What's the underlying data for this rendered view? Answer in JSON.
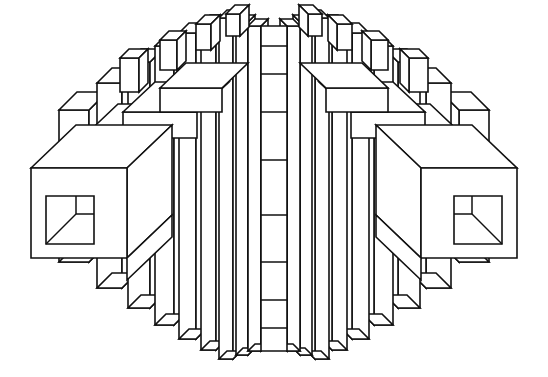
{
  "artwork": {
    "title": "Axonometric Radial Block Structure",
    "style": "black-and-white line drawing",
    "canvas": {
      "width": 548,
      "height": 377
    },
    "background_color": "#ffffff",
    "line_color": "#111111",
    "fill_color": "#ffffff",
    "line_width": 1.6,
    "symmetry": "bilateral-mirror-about-vertical-center",
    "center_x": 274,
    "description": "An oval silhouette built from stepped rectangular slabs radiating outward from a central vertical panel; the outermost left and right blocks are large cubes each containing a square window with a quarter square and a diagonal."
  },
  "center_panel": {
    "name": "central-vertical-panel",
    "x": 261,
    "width": 26,
    "top": 26,
    "bottom": 351,
    "divider_y": [
      46,
      74,
      112,
      160,
      215,
      262,
      300,
      328
    ]
  },
  "ring_columns": {
    "note": "Each ring is a mirrored pair of vertical slab columns stepping outward and downward.",
    "rings": [
      {
        "index": 0,
        "x_offset": 13,
        "slab_width": 13,
        "top": 26,
        "bottom": 351,
        "depth": 7,
        "riser": 0
      },
      {
        "index": 1,
        "x_offset": 26,
        "slab_width": 12,
        "top": 22,
        "bottom": 355,
        "depth": 7,
        "riser": 0
      },
      {
        "index": 2,
        "x_offset": 41,
        "slab_width": 14,
        "top": 18,
        "bottom": 359,
        "depth": 8,
        "riser": 0
      },
      {
        "index": 3,
        "x_offset": 58,
        "slab_width": 15,
        "top": 24,
        "bottom": 350,
        "depth": 9,
        "riser": 0
      },
      {
        "index": 4,
        "x_offset": 78,
        "slab_width": 17,
        "top": 33,
        "bottom": 339,
        "depth": 10,
        "riser": 0
      },
      {
        "index": 5,
        "x_offset": 100,
        "slab_width": 19,
        "top": 46,
        "bottom": 325,
        "depth": 11,
        "riser": 0
      },
      {
        "index": 6,
        "x_offset": 124,
        "slab_width": 22,
        "top": 62,
        "bottom": 308,
        "depth": 13,
        "riser": 0
      },
      {
        "index": 7,
        "x_offset": 152,
        "slab_width": 25,
        "top": 83,
        "bottom": 288,
        "depth": 15,
        "riser": 0
      },
      {
        "index": 8,
        "x_offset": 185,
        "slab_width": 30,
        "top": 110,
        "bottom": 262,
        "depth": 18,
        "riser": 0
      }
    ]
  },
  "cap_blocks": {
    "note": "Short raised caps sitting on top of alternating columns, drawn as small 3-face boxes.",
    "left": [
      {
        "name": "cap-1",
        "x": 226,
        "y": 14,
        "w": 14,
        "h": 22
      },
      {
        "name": "cap-2",
        "x": 196,
        "y": 24,
        "w": 15,
        "h": 26
      },
      {
        "name": "cap-3",
        "x": 160,
        "y": 40,
        "w": 17,
        "h": 30
      },
      {
        "name": "cap-4",
        "x": 120,
        "y": 58,
        "w": 19,
        "h": 34
      }
    ],
    "right": [
      {
        "name": "cap-1",
        "x": 308,
        "y": 14,
        "w": 14,
        "h": 22
      },
      {
        "name": "cap-2",
        "x": 337,
        "y": 24,
        "w": 15,
        "h": 26
      },
      {
        "name": "cap-3",
        "x": 371,
        "y": 40,
        "w": 17,
        "h": 30
      },
      {
        "name": "cap-4",
        "x": 409,
        "y": 58,
        "w": 19,
        "h": 34
      }
    ]
  },
  "outer_cubes": {
    "note": "Two large cubes, one on each side, each with a square window panel.",
    "left": {
      "name": "left-outer-cube",
      "front_x": 31,
      "front_y": 168,
      "front_w": 96,
      "front_h": 90,
      "depth_dx": 45,
      "depth_dy": -43,
      "window": {
        "x": 46,
        "y": 196,
        "size": 48,
        "quarter": 18,
        "diagonal": "bottom-left-to-quarter-corner"
      }
    },
    "right": {
      "name": "right-outer-cube",
      "front_x": 421,
      "front_y": 168,
      "front_w": 96,
      "front_h": 90,
      "depth_dx": -45,
      "depth_dy": -43,
      "window": {
        "x": 454,
        "y": 196,
        "size": 48,
        "quarter": 18,
        "diagonal": "bottom-right-to-quarter-corner"
      }
    }
  },
  "upper_slabs": {
    "note": "Wide horizontal slabs stepping up-and-inward behind the outer cubes, drawn with top and front faces.",
    "left": [
      {
        "name": "slab-a",
        "x": 31,
        "y": 168,
        "w": 96,
        "h": 0,
        "top_dx": 45,
        "top_dy": -43
      },
      {
        "name": "slab-b",
        "x": 80,
        "y": 140,
        "w": 86,
        "h": 28,
        "top_dx": 38,
        "top_dy": -36
      },
      {
        "name": "slab-c",
        "x": 123,
        "y": 112,
        "w": 74,
        "h": 26,
        "top_dx": 32,
        "top_dy": -30
      },
      {
        "name": "slab-d",
        "x": 160,
        "y": 88,
        "w": 62,
        "h": 24,
        "top_dx": 26,
        "top_dy": -25
      }
    ],
    "right": [
      {
        "name": "slab-a",
        "x": 421,
        "y": 168,
        "w": 96,
        "h": 0,
        "top_dx": -45,
        "top_dy": -43
      },
      {
        "name": "slab-b",
        "x": 382,
        "y": 140,
        "w": 86,
        "h": 28,
        "top_dx": -38,
        "top_dy": -36
      },
      {
        "name": "slab-c",
        "x": 351,
        "y": 112,
        "w": 74,
        "h": 26,
        "top_dx": -32,
        "top_dy": -30
      },
      {
        "name": "slab-d",
        "x": 326,
        "y": 88,
        "w": 62,
        "h": 24,
        "top_dx": -26,
        "top_dy": -25
      }
    ]
  },
  "lower_steps": {
    "note": "Bottom edges of the columns step down-and-inward, each showing a thin underside face.",
    "left_step_ys": [
      262,
      288,
      308,
      325,
      339,
      350,
      359,
      355,
      351
    ],
    "right_step_ys": [
      262,
      288,
      308,
      325,
      339,
      350,
      359,
      355,
      351
    ]
  }
}
